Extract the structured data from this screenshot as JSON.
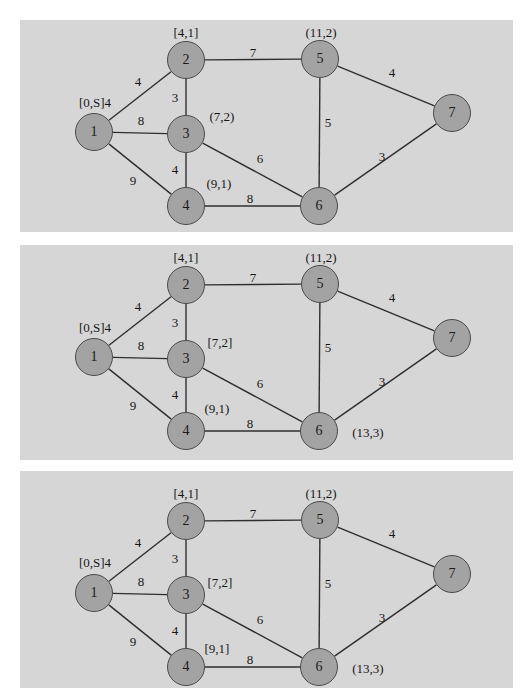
{
  "page": {
    "header_fragment": "",
    "background": "#ffffff",
    "panel_background": "#d6d6d6",
    "node_fill": "#a3a3a3",
    "node_stroke": "#4a4a4a",
    "text_color": "#161616"
  },
  "graph": {
    "nodes": [
      {
        "id": "1",
        "label": "1",
        "x": 74,
        "y": 112
      },
      {
        "id": "2",
        "label": "2",
        "x": 166,
        "y": 40
      },
      {
        "id": "3",
        "label": "3",
        "x": 166,
        "y": 114
      },
      {
        "id": "4",
        "label": "4",
        "x": 166,
        "y": 186
      },
      {
        "id": "5",
        "label": "5",
        "x": 300,
        "y": 39
      },
      {
        "id": "6",
        "label": "6",
        "x": 299,
        "y": 186
      },
      {
        "id": "7",
        "label": "7",
        "x": 432,
        "y": 93
      }
    ],
    "edges": [
      {
        "from": "1",
        "to": "2",
        "weight": "4",
        "lx": 118,
        "ly": 62
      },
      {
        "from": "1",
        "to": "3",
        "weight": "8",
        "lx": 121,
        "ly": 101
      },
      {
        "from": "1",
        "to": "4",
        "weight": "9",
        "lx": 113,
        "ly": 161
      },
      {
        "from": "2",
        "to": "3",
        "weight": "3",
        "lx": 155,
        "ly": 78
      },
      {
        "from": "2",
        "to": "5",
        "weight": "7",
        "lx": 233,
        "ly": 33
      },
      {
        "from": "3",
        "to": "4",
        "weight": "4",
        "lx": 155,
        "ly": 150
      },
      {
        "from": "3",
        "to": "6",
        "weight": "6",
        "lx": 240,
        "ly": 139
      },
      {
        "from": "4",
        "to": "6",
        "weight": "8",
        "lx": 230,
        "ly": 179
      },
      {
        "from": "5",
        "to": "6",
        "weight": "5",
        "lx": 308,
        "ly": 103
      },
      {
        "from": "5",
        "to": "7",
        "weight": "4",
        "lx": 372,
        "ly": 53
      },
      {
        "from": "6",
        "to": "7",
        "weight": "3",
        "lx": 362,
        "ly": 137
      }
    ]
  },
  "panels": [
    {
      "name": "panel-1",
      "node_labels": [
        {
          "node": "1",
          "text": "[0,S]4",
          "x": 75,
          "y": 83
        },
        {
          "node": "2",
          "text": "[4,1]",
          "x": 166,
          "y": 13
        },
        {
          "node": "3",
          "text": "(7,2)",
          "x": 202,
          "y": 97
        },
        {
          "node": "4",
          "text": "(9,1)",
          "x": 199,
          "y": 164
        },
        {
          "node": "5",
          "text": "(11,2)",
          "x": 301,
          "y": 13
        }
      ]
    },
    {
      "name": "panel-2",
      "node_labels": [
        {
          "node": "1",
          "text": "[0,S]4",
          "x": 75,
          "y": 83
        },
        {
          "node": "2",
          "text": "[4,1]",
          "x": 166,
          "y": 13
        },
        {
          "node": "3",
          "text": "[7,2]",
          "x": 200,
          "y": 98
        },
        {
          "node": "4",
          "text": "(9,1)",
          "x": 197,
          "y": 164
        },
        {
          "node": "5",
          "text": "(11,2)",
          "x": 301,
          "y": 13
        },
        {
          "node": "6",
          "text": "(13,3)",
          "x": 348,
          "y": 188
        }
      ]
    },
    {
      "name": "panel-3",
      "node_labels": [
        {
          "node": "1",
          "text": "[0,S]4",
          "x": 75,
          "y": 92
        },
        {
          "node": "2",
          "text": "[4,1]",
          "x": 166,
          "y": 23
        },
        {
          "node": "3",
          "text": "[7,2]",
          "x": 200,
          "y": 112
        },
        {
          "node": "4",
          "text": "[9,1]",
          "x": 197,
          "y": 178
        },
        {
          "node": "5",
          "text": "(11,2)",
          "x": 301,
          "y": 23
        },
        {
          "node": "6",
          "text": "(13,3)",
          "x": 348,
          "y": 198
        }
      ]
    }
  ]
}
